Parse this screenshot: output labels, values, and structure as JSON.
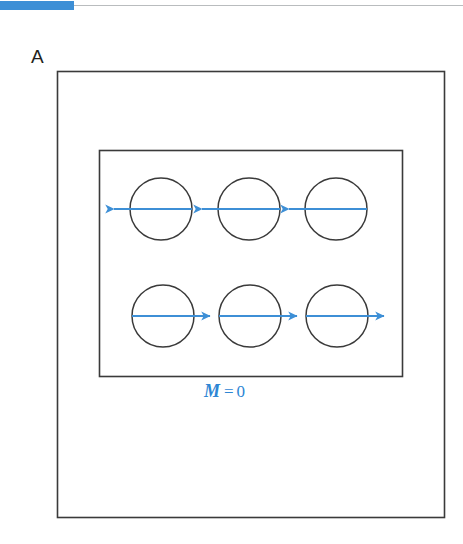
{
  "figure": {
    "panel_label": "A",
    "caption": {
      "symbol": "M",
      "relation": "=",
      "value": "0",
      "full_text": "M = 0",
      "color": "#2e86d4"
    },
    "colors": {
      "accent_blue": "#3d8fd6",
      "arrow_blue": "#3d8fd6",
      "outline_black": "#3a3a3a",
      "background": "#ffffff",
      "rule_gray": "#b9bcbe"
    },
    "outer_box": {
      "x": 57,
      "y": 71,
      "width": 387,
      "height": 446
    },
    "inner_box": {
      "x": 99,
      "y": 150,
      "width": 303,
      "height": 226
    },
    "domains": [
      {
        "name": "domain-top-left",
        "cx": 161,
        "cy": 209,
        "r": 31,
        "direction": "left",
        "arrow_label": "magnetic-moment-arrow"
      },
      {
        "name": "domain-top-center",
        "cx": 249,
        "cy": 209,
        "r": 31,
        "direction": "left",
        "arrow_label": "magnetic-moment-arrow"
      },
      {
        "name": "domain-top-right",
        "cx": 336,
        "cy": 209,
        "r": 31,
        "direction": "left",
        "arrow_label": "magnetic-moment-arrow"
      },
      {
        "name": "domain-bottom-left",
        "cx": 163,
        "cy": 316,
        "r": 31,
        "direction": "right",
        "arrow_label": "magnetic-moment-arrow"
      },
      {
        "name": "domain-bottom-center",
        "cx": 250,
        "cy": 316,
        "r": 31,
        "direction": "right",
        "arrow_label": "magnetic-moment-arrow"
      },
      {
        "name": "domain-bottom-right",
        "cx": 337,
        "cy": 316,
        "r": 31,
        "direction": "right",
        "arrow_label": "magnetic-moment-arrow"
      }
    ]
  }
}
